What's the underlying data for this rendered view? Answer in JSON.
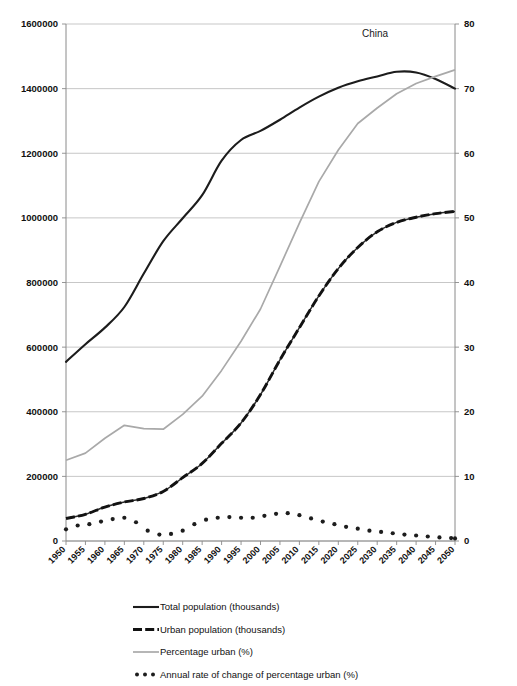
{
  "chart_data": {
    "type": "line",
    "title": "China",
    "xlabel": "",
    "ylabel": "",
    "y2label": "",
    "grid": true,
    "legend_position": "bottom",
    "x": [
      1950,
      1955,
      1960,
      1965,
      1970,
      1975,
      1980,
      1985,
      1990,
      1995,
      2000,
      2005,
      2010,
      2015,
      2020,
      2025,
      2030,
      2035,
      2040,
      2045,
      2050
    ],
    "xlim": [
      1950,
      2050
    ],
    "xtick_labels": [
      "1950",
      "1955",
      "1960",
      "1965",
      "1970",
      "1975",
      "1980",
      "1985",
      "1990",
      "1995",
      "2000",
      "2005",
      "2010",
      "2015",
      "2020",
      "2025",
      "2030",
      "2035",
      "2040",
      "2045",
      "2050"
    ],
    "ylim": [
      0,
      1600000
    ],
    "ytick_labels": [
      "0",
      "200000",
      "400000",
      "600000",
      "800000",
      "1000000",
      "1200000",
      "1400000",
      "1600000"
    ],
    "ytick_values": [
      0,
      200000,
      400000,
      600000,
      800000,
      1000000,
      1200000,
      1400000,
      1600000
    ],
    "y2lim": [
      0,
      80
    ],
    "y2tick_labels": [
      "0",
      "10",
      "20",
      "30",
      "40",
      "50",
      "60",
      "70",
      "80"
    ],
    "y2tick_values": [
      0,
      10,
      20,
      30,
      40,
      50,
      60,
      70,
      80
    ],
    "series": [
      {
        "name": "Total population (thousands)",
        "axis": "left",
        "style": "solid-black",
        "values": [
          554419,
          609005,
          660330,
          724218,
          827601,
          927808,
          998877,
          1070175,
          1176884,
          1240921,
          1269117,
          1303720,
          1341335,
          1375199,
          1402847,
          1422806,
          1437626,
          1452000,
          1450000,
          1430000,
          1400000
        ]
      },
      {
        "name": "Urban population (thousands)",
        "axis": "left",
        "style": "dashed-black-thick",
        "values": [
          69524,
          82720,
          105052,
          120680,
          131500,
          153400,
          196216,
          240020,
          302170,
          365435,
          453204,
          560561,
          660287,
          758360,
          842933,
          908518,
          957000,
          986000,
          1002000,
          1013000,
          1020000
        ]
      },
      {
        "name": "Percentage urban (%)",
        "axis": "right",
        "style": "solid-grey",
        "values": [
          12.5,
          13.6,
          15.9,
          17.9,
          17.4,
          17.3,
          19.6,
          22.4,
          26.4,
          30.9,
          35.9,
          42.5,
          49.2,
          55.6,
          60.5,
          64.6,
          67.0,
          69.2,
          70.8,
          71.9,
          72.9
        ]
      },
      {
        "name": "Annual rate of change of percentage urban (%)",
        "axis": "right",
        "style": "dotted-black",
        "x": [
          1950,
          1953,
          1956,
          1959,
          1962,
          1965,
          1968,
          1971,
          1974,
          1977,
          1980,
          1983,
          1986,
          1989,
          1992,
          1995,
          1998,
          2001,
          2004,
          2007,
          2010,
          2013,
          2016,
          2019,
          2022,
          2025,
          2028,
          2031,
          2034,
          2037,
          2040,
          2043,
          2046,
          2049,
          2050
        ],
        "values": [
          1.8,
          2.4,
          2.6,
          3.0,
          3.4,
          3.6,
          2.9,
          1.6,
          1.0,
          1.1,
          1.6,
          2.6,
          3.3,
          3.6,
          3.7,
          3.6,
          3.6,
          3.9,
          4.2,
          4.3,
          4.0,
          3.5,
          3.0,
          2.6,
          2.2,
          1.9,
          1.6,
          1.4,
          1.2,
          1.0,
          0.85,
          0.7,
          0.55,
          0.45,
          0.4
        ]
      }
    ]
  },
  "legend": {
    "items": [
      {
        "label": "Total population (thousands)",
        "marker": "solid-black-line"
      },
      {
        "label": "Urban population (thousands)",
        "marker": "dashed-black-line"
      },
      {
        "label": "Percentage urban (%)",
        "marker": "solid-grey-line"
      },
      {
        "label": "Annual rate of change of percentage urban (%)",
        "marker": "dotted-black-line"
      }
    ]
  }
}
